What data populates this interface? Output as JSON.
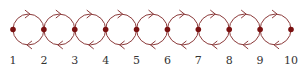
{
  "diagram": {
    "type": "chain-of-loops",
    "colors": {
      "edge": "#8b3a3a",
      "node": "#7a1010",
      "label": "#333333",
      "background": "#ffffff"
    },
    "nodes": [
      {
        "id": 1,
        "label": "1"
      },
      {
        "id": 2,
        "label": "2"
      },
      {
        "id": 3,
        "label": "3"
      },
      {
        "id": 4,
        "label": "4"
      },
      {
        "id": 5,
        "label": "5"
      },
      {
        "id": 6,
        "label": "6"
      },
      {
        "id": 7,
        "label": "7"
      },
      {
        "id": 8,
        "label": "8"
      },
      {
        "id": 9,
        "label": "9"
      },
      {
        "id": 10,
        "label": "10"
      }
    ],
    "edges": [
      {
        "from": 1,
        "to": 2,
        "arc": "top",
        "direction": "right"
      },
      {
        "from": 2,
        "to": 1,
        "arc": "bottom",
        "direction": "left"
      },
      {
        "from": 2,
        "to": 3,
        "arc": "top",
        "direction": "right"
      },
      {
        "from": 3,
        "to": 2,
        "arc": "bottom",
        "direction": "left"
      },
      {
        "from": 3,
        "to": 4,
        "arc": "top",
        "direction": "right"
      },
      {
        "from": 4,
        "to": 3,
        "arc": "bottom",
        "direction": "left"
      },
      {
        "from": 4,
        "to": 5,
        "arc": "top",
        "direction": "right"
      },
      {
        "from": 5,
        "to": 4,
        "arc": "bottom",
        "direction": "left"
      },
      {
        "from": 5,
        "to": 6,
        "arc": "top",
        "direction": "right"
      },
      {
        "from": 6,
        "to": 5,
        "arc": "bottom",
        "direction": "left"
      },
      {
        "from": 6,
        "to": 7,
        "arc": "top",
        "direction": "right"
      },
      {
        "from": 7,
        "to": 6,
        "arc": "bottom",
        "direction": "left"
      },
      {
        "from": 7,
        "to": 8,
        "arc": "top",
        "direction": "right"
      },
      {
        "from": 8,
        "to": 7,
        "arc": "bottom",
        "direction": "left"
      },
      {
        "from": 8,
        "to": 9,
        "arc": "top",
        "direction": "right"
      },
      {
        "from": 9,
        "to": 8,
        "arc": "bottom",
        "direction": "left"
      },
      {
        "from": 9,
        "to": 10,
        "arc": "top",
        "direction": "right"
      },
      {
        "from": 10,
        "to": 9,
        "arc": "bottom",
        "direction": "left"
      }
    ]
  }
}
